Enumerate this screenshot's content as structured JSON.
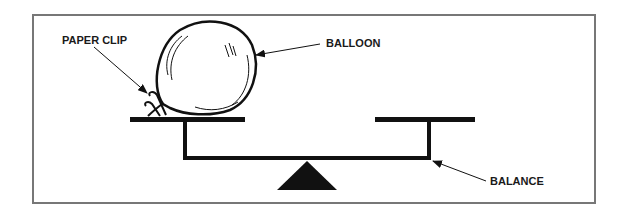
{
  "diagram": {
    "labels": {
      "paper_clip": "PAPER CLIP",
      "balloon": "BALLOON",
      "balance": "BALANCE"
    },
    "colors": {
      "frame": "#777777",
      "ink": "#111111",
      "background": "#ffffff"
    }
  }
}
